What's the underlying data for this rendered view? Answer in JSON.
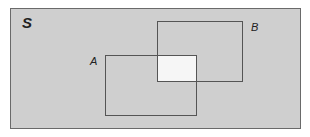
{
  "diagram": {
    "type": "venn-rectangles",
    "universe_label": "S",
    "sets": [
      {
        "label": "A"
      },
      {
        "label": "B"
      }
    ],
    "highlighted_region": "A ∩ B",
    "colors": {
      "background": "#cfcfcf",
      "highlight": "#f6f6f6",
      "border": "#555555"
    }
  }
}
